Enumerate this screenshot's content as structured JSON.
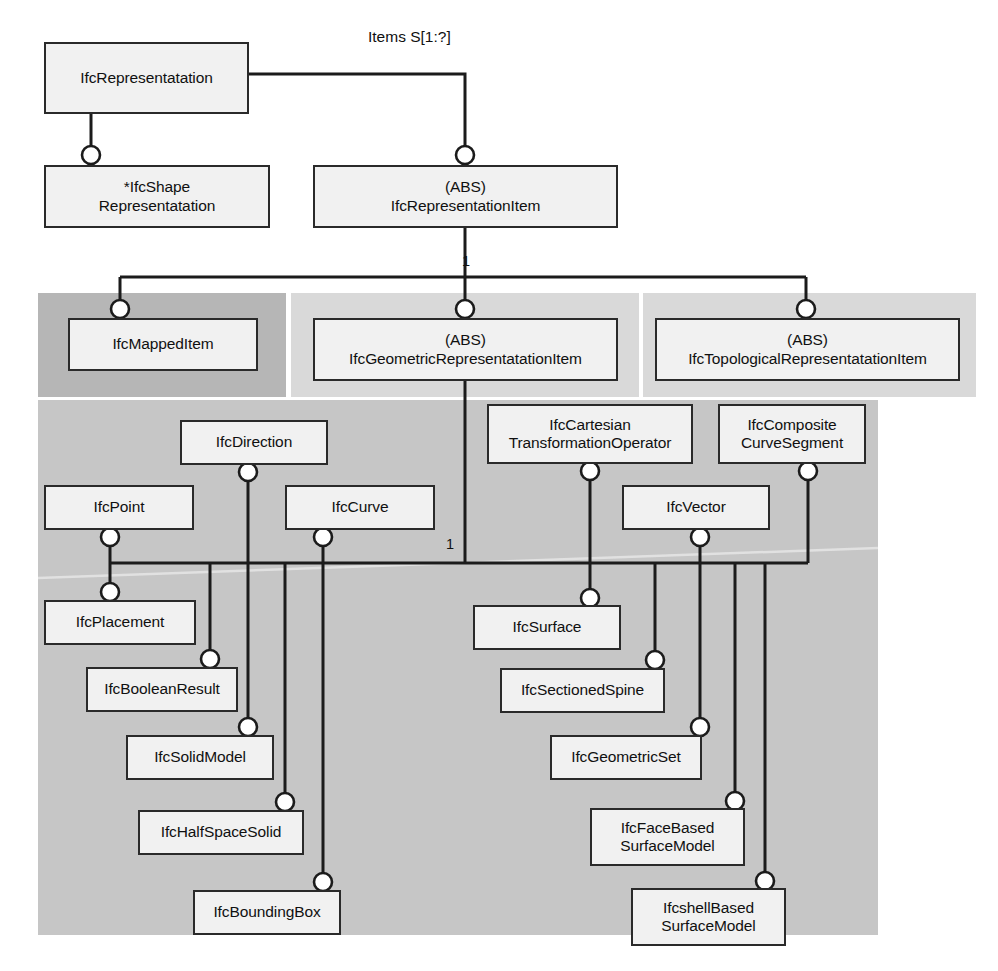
{
  "diagram": {
    "colors": {
      "box_fill": "#f1f1f1",
      "box_stroke": "#2a2a2a",
      "panel_dark": "#b6b6b6",
      "panel_light": "#d9d9d9",
      "panel_body": "#c6c6c6",
      "line": "#1b1b1b",
      "background": "#ffffff"
    },
    "panels": [
      {
        "name": "mapped-item-panel",
        "shade": "dark",
        "x": 38,
        "y": 293,
        "w": 248,
        "h": 104
      },
      {
        "name": "geometric-panel",
        "shade": "light",
        "x": 291,
        "y": 293,
        "w": 348,
        "h": 104
      },
      {
        "name": "topological-panel",
        "shade": "light",
        "x": 643,
        "y": 293,
        "w": 333,
        "h": 104
      },
      {
        "name": "geometric-body-panel",
        "shade": "body",
        "x": 38,
        "y": 400,
        "w": 840,
        "h": 535
      }
    ],
    "entities": [
      {
        "id": "ifc-representatation",
        "label": "IfcRepresentatation",
        "x": 44,
        "y": 42,
        "w": 205,
        "h": 72
      },
      {
        "id": "ifc-shape-representatation",
        "label": "*IfcShape\nRepresentatation",
        "x": 44,
        "y": 165,
        "w": 226,
        "h": 63
      },
      {
        "id": "ifc-representation-item",
        "label": "(ABS)\nIfcRepresentationItem",
        "x": 313,
        "y": 165,
        "w": 305,
        "h": 63
      },
      {
        "id": "ifc-mapped-item",
        "label": "IfcMappedItem",
        "x": 68,
        "y": 318,
        "w": 190,
        "h": 53
      },
      {
        "id": "ifc-geometric-representatation-item",
        "label": "(ABS)\nIfcGeometricRepresentatationItem",
        "x": 313,
        "y": 318,
        "w": 305,
        "h": 63
      },
      {
        "id": "ifc-topological-representatation-item",
        "label": "(ABS)\nIfcTopologicalRepresentatationItem",
        "x": 655,
        "y": 318,
        "w": 305,
        "h": 63
      },
      {
        "id": "ifc-direction",
        "label": "IfcDirection",
        "x": 180,
        "y": 420,
        "w": 148,
        "h": 45
      },
      {
        "id": "ifc-cartesian-transformation-operator",
        "label": "IfcCartesian\nTransformationOperator",
        "x": 487,
        "y": 404,
        "w": 206,
        "h": 60
      },
      {
        "id": "ifc-composite-curve-segment",
        "label": "IfcComposite\nCurveSegment",
        "x": 718,
        "y": 404,
        "w": 148,
        "h": 60
      },
      {
        "id": "ifc-point",
        "label": "IfcPoint",
        "x": 44,
        "y": 485,
        "w": 150,
        "h": 45
      },
      {
        "id": "ifc-curve",
        "label": "IfcCurve",
        "x": 285,
        "y": 485,
        "w": 150,
        "h": 45
      },
      {
        "id": "ifc-vector",
        "label": "IfcVector",
        "x": 622,
        "y": 485,
        "w": 148,
        "h": 45
      },
      {
        "id": "ifc-placement",
        "label": "IfcPlacement",
        "x": 44,
        "y": 600,
        "w": 152,
        "h": 45
      },
      {
        "id": "ifc-surface",
        "label": "IfcSurface",
        "x": 473,
        "y": 605,
        "w": 148,
        "h": 45
      },
      {
        "id": "ifc-boolean-result",
        "label": "IfcBooleanResult",
        "x": 86,
        "y": 667,
        "w": 152,
        "h": 45
      },
      {
        "id": "ifc-sectioned-spine",
        "label": "IfcSectionedSpine",
        "x": 500,
        "y": 668,
        "w": 165,
        "h": 45
      },
      {
        "id": "ifc-solid-model",
        "label": "IfcSolidModel",
        "x": 126,
        "y": 735,
        "w": 148,
        "h": 45
      },
      {
        "id": "ifc-geometric-set",
        "label": "IfcGeometricSet",
        "x": 550,
        "y": 735,
        "w": 152,
        "h": 45
      },
      {
        "id": "ifc-half-space-solid",
        "label": "IfcHalfSpaceSolid",
        "x": 138,
        "y": 810,
        "w": 166,
        "h": 45
      },
      {
        "id": "ifc-face-based-surface-model",
        "label": "IfcFaceBased\nSurfaceModel",
        "x": 590,
        "y": 808,
        "w": 155,
        "h": 58
      },
      {
        "id": "ifc-bounding-box",
        "label": "IfcBoundingBox",
        "x": 193,
        "y": 890,
        "w": 148,
        "h": 45
      },
      {
        "id": "ifcshell-based-surface-model",
        "label": "IfcshellBased\nSurfaceModel",
        "x": 631,
        "y": 888,
        "w": 155,
        "h": 58
      }
    ],
    "edge_labels": [
      {
        "id": "items-label",
        "text": "Items S[1:?]",
        "x": 368,
        "y": 28
      }
    ],
    "cardinality_labels": [
      {
        "id": "card-top",
        "text": "1",
        "x": 462,
        "y": 253
      },
      {
        "id": "card-middle",
        "text": "1",
        "x": 446,
        "y": 536
      }
    ]
  }
}
